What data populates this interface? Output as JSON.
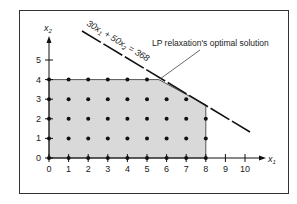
{
  "figure": {
    "axes": {
      "x_label": "x",
      "x_sub": "1",
      "y_label": "x",
      "y_sub": "2",
      "x_ticks": [
        "0",
        "1",
        "2",
        "3",
        "4",
        "5",
        "6",
        "7",
        "8",
        "9",
        "10"
      ],
      "y_ticks": [
        "0",
        "1",
        "2",
        "3",
        "4",
        "5"
      ]
    },
    "constraint_line": {
      "label_part1": "30x",
      "label_sub1": "1",
      "label_part2": " + 50x",
      "label_sub2": "2",
      "label_part3": " = 368"
    },
    "annotation": "LP relaxation's optimal solution",
    "colors": {
      "feasible_fill": "#d9d9d9",
      "ink": "#111111",
      "frame": "#333333"
    },
    "feasible_region_vertices": [
      [
        0,
        0
      ],
      [
        0,
        4
      ],
      [
        5.6,
        4
      ],
      [
        8,
        2.7
      ],
      [
        8,
        0
      ]
    ],
    "lp_optimum": [
      5.6,
      4
    ],
    "integer_points_note": "all integer (x1,x2) with 0<=x1<=8, 0<=x2<=4 inside region"
  }
}
